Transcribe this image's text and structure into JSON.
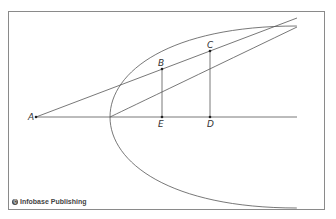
{
  "figure": {
    "credit": "Infobase Publishing",
    "credit_symbol": "©",
    "colors": {
      "line": "#555555",
      "frame": "#8a8a8a",
      "label": "#333333",
      "background": "#ffffff"
    },
    "points": {
      "A": "A",
      "B": "B",
      "C": "C",
      "D": "D",
      "E": "E"
    }
  }
}
